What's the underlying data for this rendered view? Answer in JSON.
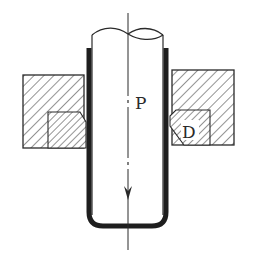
{
  "diagram": {
    "type": "deep-drawing-cross-section",
    "labels": {
      "punch": "P",
      "die": "D"
    },
    "colors": {
      "line": "#2a2a2a",
      "background": "#ffffff",
      "wall": "#1e1e1e"
    },
    "elements": [
      {
        "id": "punch",
        "label": "P",
        "description": "Cylindrical punch with wavy break line at top"
      },
      {
        "id": "cup",
        "description": "Drawn cup (thick black wall) around punch"
      },
      {
        "id": "die-left",
        "description": "Left hatched die block with chamfered insert"
      },
      {
        "id": "die-right",
        "label": "D",
        "description": "Right hatched die block with chamfered insert labeled D"
      },
      {
        "id": "centerline",
        "description": "Vertical dash-dot axis with downward arrow indicating punch motion"
      }
    ]
  }
}
